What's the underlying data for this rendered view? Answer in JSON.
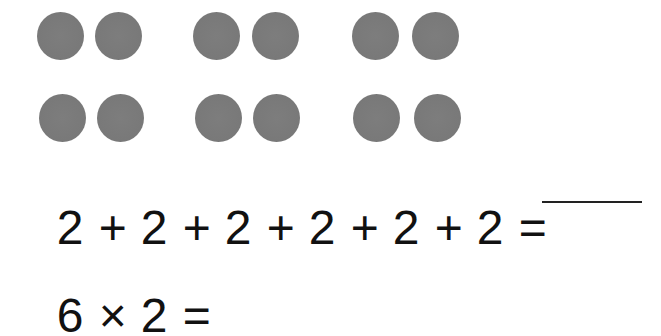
{
  "worksheet": {
    "dot_groups": {
      "rows": 2,
      "groups_per_row": 3,
      "dots_per_group": 2,
      "dot_color": "#7a7a7a",
      "total_dots": 12
    },
    "equation_repeated_addition": {
      "terms": [
        "2",
        "+",
        "2",
        "+",
        "2",
        "+",
        "2",
        "+",
        "2",
        "+",
        "2",
        "="
      ],
      "answer_blank": ""
    },
    "equation_multiplication": {
      "terms": [
        "6",
        "×",
        "2",
        "="
      ]
    }
  }
}
